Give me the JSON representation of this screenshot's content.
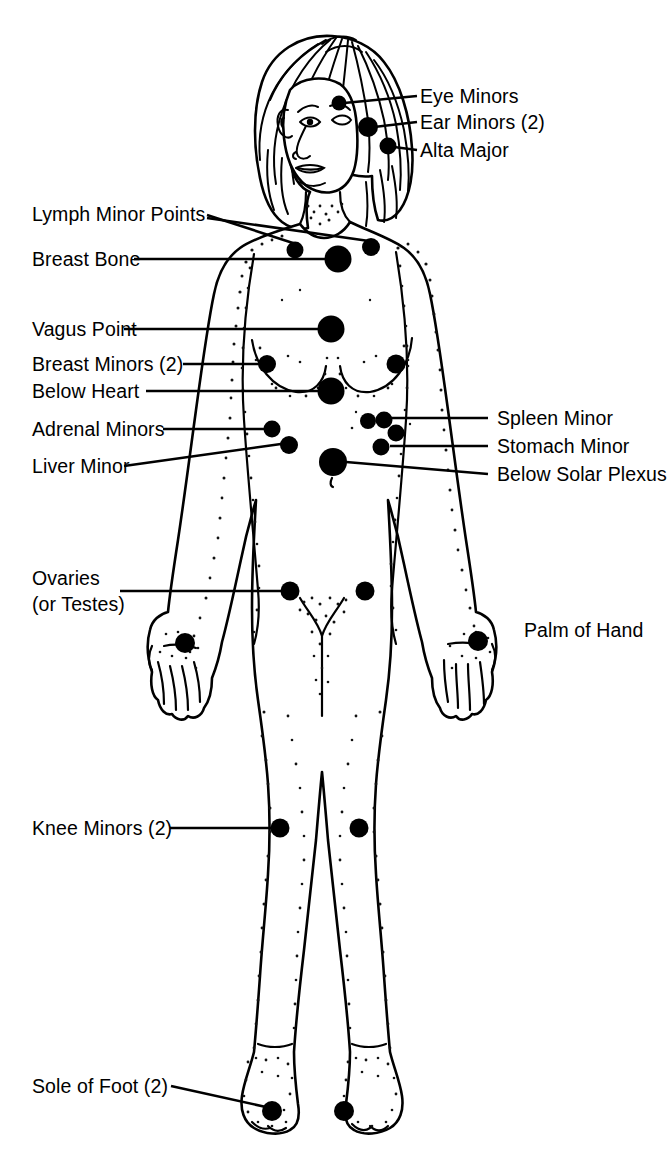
{
  "diagram": {
    "background_color": "#ffffff",
    "ink_color": "#000000"
  },
  "labels": {
    "eye_minors": "Eye Minors",
    "ear_minors": "Ear Minors (2)",
    "alta_major": "Alta Major",
    "lymph_minor_points": "Lymph Minor Points",
    "breast_bone": "Breast Bone",
    "vagus_point": "Vagus Point",
    "breast_minors": "Breast Minors (2)",
    "below_heart": "Below Heart",
    "adrenal_minors": "Adrenal Minors",
    "liver_minor": "Liver Minor",
    "spleen_minor": "Spleen Minor",
    "stomach_minor": "Stomach Minor",
    "below_solar_plexus": "Below Solar Plexus",
    "ovaries_line1": "Ovaries",
    "ovaries_line2": "(or Testes)",
    "palm_of_hand": "Palm of Hand",
    "knee_minors": "Knee Minors (2)",
    "sole_of_foot": "Sole of Foot (2)"
  },
  "points": [
    {
      "name": "eye-minor",
      "x": 339,
      "y": 103,
      "r": 7.5
    },
    {
      "name": "ear-minor",
      "x": 368,
      "y": 127,
      "r": 10.0
    },
    {
      "name": "alta-major",
      "x": 388,
      "y": 146,
      "r": 8.5
    },
    {
      "name": "lymph-minor-left",
      "x": 295,
      "y": 250,
      "r": 8.5
    },
    {
      "name": "lymph-minor-right",
      "x": 371,
      "y": 247,
      "r": 9.0
    },
    {
      "name": "breast-bone",
      "x": 338,
      "y": 259,
      "r": 13.5
    },
    {
      "name": "vagus-point",
      "x": 331,
      "y": 329,
      "r": 13.5
    },
    {
      "name": "breast-minor-left",
      "x": 267,
      "y": 364,
      "r": 9.0
    },
    {
      "name": "breast-minor-right",
      "x": 396,
      "y": 364,
      "r": 9.5
    },
    {
      "name": "below-heart",
      "x": 331,
      "y": 391,
      "r": 13.5
    },
    {
      "name": "adrenal-minor-left",
      "x": 272,
      "y": 429,
      "r": 8.5
    },
    {
      "name": "liver-minor",
      "x": 289,
      "y": 445,
      "r": 9.0
    },
    {
      "name": "spleen-minor-a",
      "x": 368,
      "y": 421,
      "r": 8.0
    },
    {
      "name": "spleen-minor-b",
      "x": 384,
      "y": 420,
      "r": 8.5
    },
    {
      "name": "stomach-minor-a",
      "x": 396,
      "y": 433,
      "r": 8.5
    },
    {
      "name": "stomach-minor-b",
      "x": 381,
      "y": 447,
      "r": 8.5
    },
    {
      "name": "below-solar-plexus",
      "x": 333,
      "y": 462,
      "r": 14.0
    },
    {
      "name": "ovary-left",
      "x": 290,
      "y": 591,
      "r": 9.5
    },
    {
      "name": "ovary-right",
      "x": 365,
      "y": 591,
      "r": 9.5
    },
    {
      "name": "palm-left-hand",
      "x": 185,
      "y": 643,
      "r": 10.0
    },
    {
      "name": "palm-right-hand",
      "x": 478,
      "y": 641,
      "r": 10.0
    },
    {
      "name": "knee-minor-left",
      "x": 280,
      "y": 828,
      "r": 9.5
    },
    {
      "name": "knee-minor-right",
      "x": 359,
      "y": 828,
      "r": 9.5
    },
    {
      "name": "sole-of-foot-left",
      "x": 272,
      "y": 1111,
      "r": 10.0
    },
    {
      "name": "sole-of-foot-right",
      "x": 344,
      "y": 1111,
      "r": 10.0
    }
  ],
  "annotations": {
    "right_column_x": 420,
    "left_column_x": 32,
    "count_total_points": 25
  }
}
